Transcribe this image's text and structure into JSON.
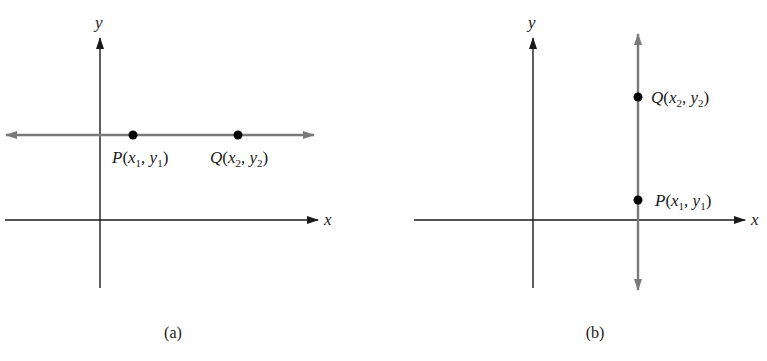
{
  "panels": [
    {
      "id": "a",
      "caption": "(a)",
      "axis_x_label": "x",
      "axis_y_label": "y",
      "line_orientation": "horizontal",
      "points": [
        {
          "name": "P",
          "open": "(",
          "x": "x",
          "xsub": "1",
          "sep": ", ",
          "y": "y",
          "ysub": "1",
          "close": ")"
        },
        {
          "name": "Q",
          "open": "(",
          "x": "x",
          "xsub": "2",
          "sep": ", ",
          "y": "y",
          "ysub": "2",
          "close": ")"
        }
      ]
    },
    {
      "id": "b",
      "caption": "(b)",
      "axis_x_label": "x",
      "axis_y_label": "y",
      "line_orientation": "vertical",
      "points": [
        {
          "name": "Q",
          "open": "(",
          "x": "x",
          "xsub": "2",
          "sep": ", ",
          "y": "y",
          "ysub": "2",
          "close": ")"
        },
        {
          "name": "P",
          "open": "(",
          "x": "x",
          "xsub": "1",
          "sep": ", ",
          "y": "y",
          "ysub": "1",
          "close": ")"
        }
      ]
    }
  ],
  "colors": {
    "axis": "#1a1a1a",
    "line": "#7a7a7a",
    "point": "#000000"
  }
}
